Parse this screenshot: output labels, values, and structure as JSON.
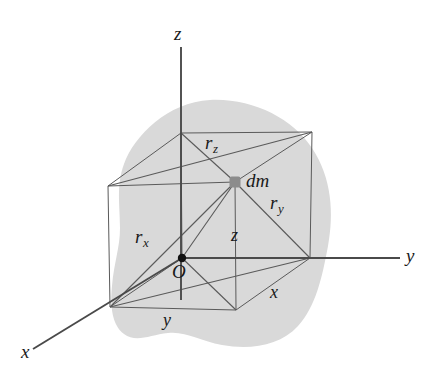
{
  "figure": {
    "colors": {
      "blob_fill": "#d9d9d9",
      "line": "#555555",
      "axis": "#4d4d4d",
      "origin_dot": "#111111",
      "dm_dot": "#8c8c8c",
      "background": "#ffffff"
    },
    "axes": [
      {
        "name": "z-axis",
        "label": "z",
        "label_x": 174,
        "label_y": 24
      },
      {
        "name": "y-axis",
        "label": "y",
        "label_x": 406,
        "label_y": 248
      },
      {
        "name": "x-axis",
        "label": "x",
        "label_x": 21,
        "label_y": 344
      }
    ],
    "points": [
      {
        "name": "origin",
        "label": "O",
        "label_x": 173,
        "label_y": 264,
        "x": 182,
        "y": 258
      },
      {
        "name": "mass-element",
        "label": "dm",
        "label_x": 246,
        "label_y": 173,
        "x": 235,
        "y": 182
      }
    ],
    "distance_labels": [
      {
        "name": "rz",
        "base": "r",
        "sub": "z",
        "label_x": 205,
        "label_y": 136
      },
      {
        "name": "ry",
        "base": "r",
        "sub": "y",
        "label_x": 270,
        "label_y": 196
      },
      {
        "name": "rx",
        "base": "r",
        "sub": "x",
        "label_x": 135,
        "label_y": 230
      }
    ],
    "coordinate_labels": [
      {
        "name": "z-coordinate",
        "label": "z",
        "label_x": 231,
        "label_y": 228
      },
      {
        "name": "x-coordinate",
        "label": "x",
        "label_x": 270,
        "label_y": 285
      },
      {
        "name": "y-coordinate",
        "label": "y",
        "label_x": 163,
        "label_y": 313
      }
    ]
  }
}
